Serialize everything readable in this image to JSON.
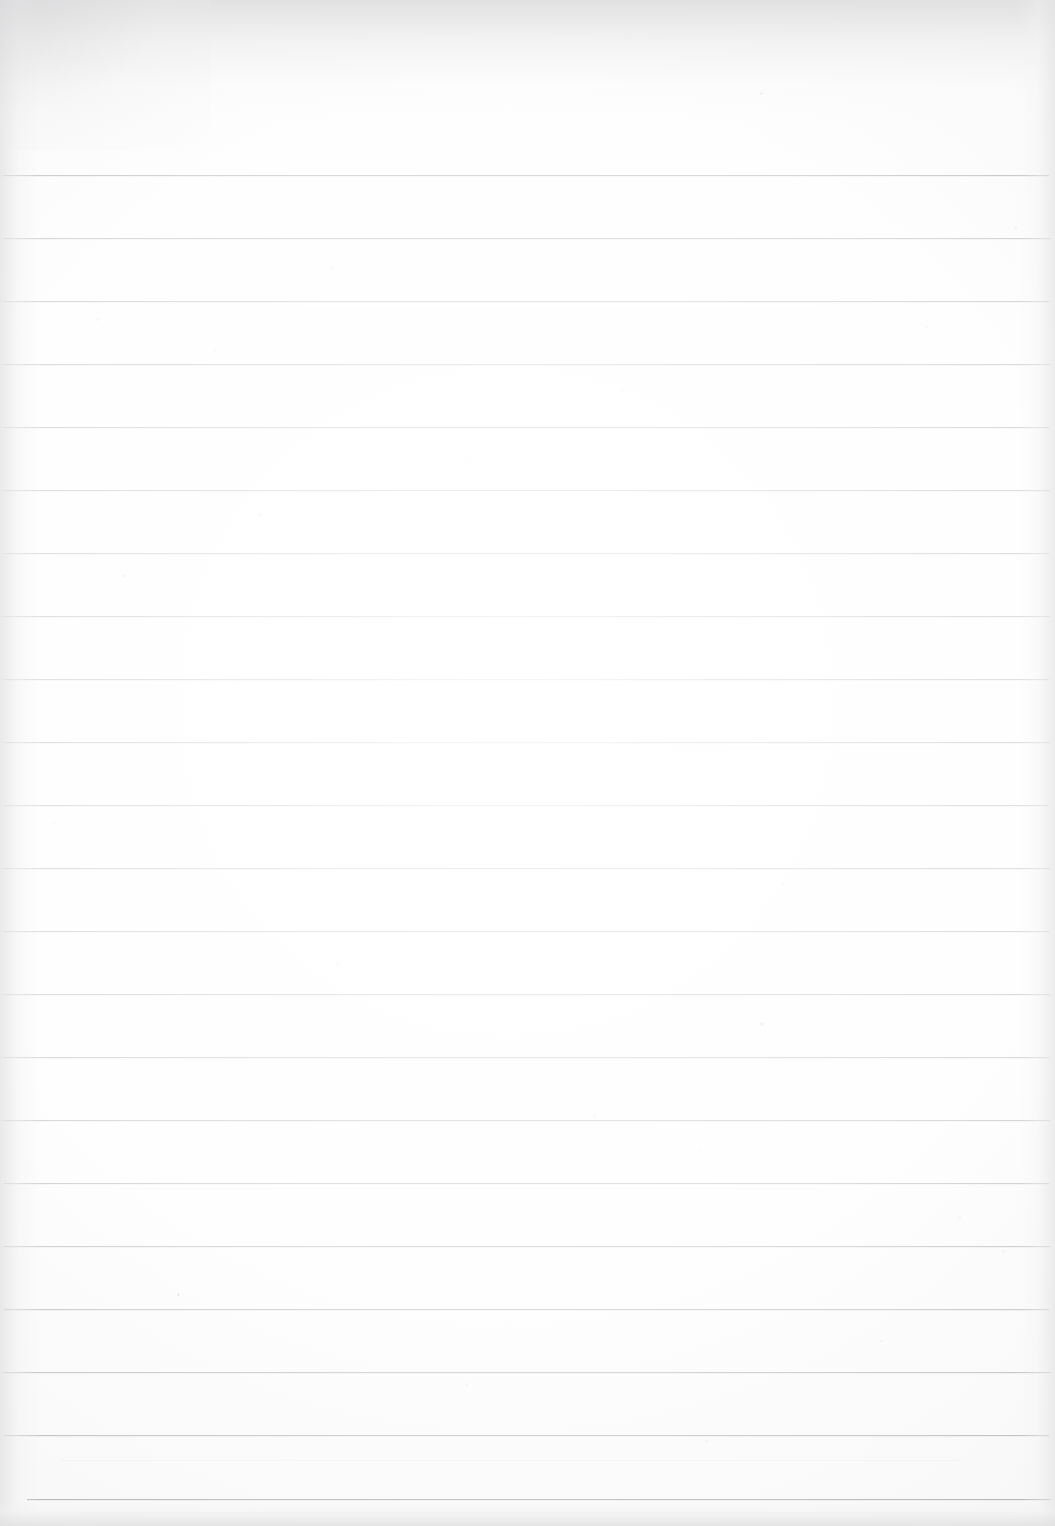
{
  "document": {
    "kind": "scanned-lined-notebook-page",
    "title": "Blank Ruled Notebook Page",
    "page_width": 1055,
    "page_height": 1526,
    "content_text": "",
    "has_handwriting": false,
    "has_printed_text": false,
    "is_blank": true
  },
  "paper": {
    "background_color": "#fcfcfc",
    "rule_color": "#54575c",
    "edge_shadow_color": "#dddddd",
    "line_count": 22,
    "line_spacing_px": 63,
    "first_line_y": 175,
    "last_line_y": 1499,
    "default_line_left_x": 4,
    "default_line_right_x": 1050,
    "top_margin_px": 175,
    "bottom_margin_px": 27
  },
  "rules": [
    {
      "index": 1,
      "y": 175,
      "x1": 3,
      "x2": 1049,
      "weight": "strong"
    },
    {
      "index": 2,
      "y": 238,
      "x1": 4,
      "x2": 1050,
      "weight": "normal"
    },
    {
      "index": 3,
      "y": 301,
      "x1": 4,
      "x2": 1049,
      "weight": "normal"
    },
    {
      "index": 4,
      "y": 364,
      "x1": 3,
      "x2": 1050,
      "weight": "normal"
    },
    {
      "index": 5,
      "y": 427,
      "x1": 4,
      "x2": 1049,
      "weight": "normal"
    },
    {
      "index": 6,
      "y": 490,
      "x1": 3,
      "x2": 1050,
      "weight": "normal"
    },
    {
      "index": 7,
      "y": 553,
      "x1": 4,
      "x2": 1049,
      "weight": "normal"
    },
    {
      "index": 8,
      "y": 616,
      "x1": 3,
      "x2": 1050,
      "weight": "normal"
    },
    {
      "index": 9,
      "y": 679,
      "x1": 4,
      "x2": 1049,
      "weight": "normal"
    },
    {
      "index": 10,
      "y": 742,
      "x1": 3,
      "x2": 1050,
      "weight": "normal"
    },
    {
      "index": 11,
      "y": 805,
      "x1": 4,
      "x2": 1049,
      "weight": "normal"
    },
    {
      "index": 12,
      "y": 868,
      "x1": 3,
      "x2": 1050,
      "weight": "normal"
    },
    {
      "index": 13,
      "y": 931,
      "x1": 4,
      "x2": 1049,
      "weight": "normal"
    },
    {
      "index": 14,
      "y": 994,
      "x1": 3,
      "x2": 1050,
      "weight": "normal"
    },
    {
      "index": 15,
      "y": 1057,
      "x1": 4,
      "x2": 1049,
      "weight": "normal"
    },
    {
      "index": 16,
      "y": 1120,
      "x1": 3,
      "x2": 1050,
      "weight": "normal"
    },
    {
      "index": 17,
      "y": 1183,
      "x1": 4,
      "x2": 1049,
      "weight": "normal"
    },
    {
      "index": 18,
      "y": 1246,
      "x1": 3,
      "x2": 1050,
      "weight": "normal"
    },
    {
      "index": 19,
      "y": 1309,
      "x1": 4,
      "x2": 1049,
      "weight": "normal"
    },
    {
      "index": 20,
      "y": 1372,
      "x1": 3,
      "x2": 1050,
      "weight": "normal"
    },
    {
      "index": 21,
      "y": 1435,
      "x1": 4,
      "x2": 1049,
      "weight": "normal"
    },
    {
      "index": 22,
      "y": 1499,
      "x1": 27,
      "x2": 1050,
      "weight": "strong"
    }
  ],
  "specks": [
    {
      "x": 760,
      "y": 92,
      "size": 3,
      "tone": "dark"
    },
    {
      "x": 629,
      "y": 36,
      "size": 2,
      "tone": "light"
    },
    {
      "x": 1014,
      "y": 226,
      "size": 3,
      "tone": "light"
    },
    {
      "x": 330,
      "y": 267,
      "size": 3,
      "tone": "light"
    },
    {
      "x": 96,
      "y": 318,
      "size": 3,
      "tone": "light"
    },
    {
      "x": 925,
      "y": 325,
      "size": 3,
      "tone": "light"
    },
    {
      "x": 214,
      "y": 350,
      "size": 3,
      "tone": "light"
    },
    {
      "x": 621,
      "y": 389,
      "size": 3,
      "tone": "light"
    },
    {
      "x": 470,
      "y": 460,
      "size": 2,
      "tone": "light"
    },
    {
      "x": 160,
      "y": 455,
      "size": 2,
      "tone": "light"
    },
    {
      "x": 258,
      "y": 513,
      "size": 4,
      "tone": "light"
    },
    {
      "x": 645,
      "y": 527,
      "size": 2,
      "tone": "light"
    },
    {
      "x": 123,
      "y": 574,
      "size": 3,
      "tone": "dark"
    },
    {
      "x": 598,
      "y": 635,
      "size": 3,
      "tone": "light"
    },
    {
      "x": 52,
      "y": 822,
      "size": 3,
      "tone": "light"
    },
    {
      "x": 781,
      "y": 883,
      "size": 3,
      "tone": "light"
    },
    {
      "x": 336,
      "y": 963,
      "size": 3,
      "tone": "light"
    },
    {
      "x": 760,
      "y": 1022,
      "size": 4,
      "tone": "dark"
    },
    {
      "x": 593,
      "y": 1114,
      "size": 3,
      "tone": "light"
    },
    {
      "x": 700,
      "y": 1150,
      "size": 2,
      "tone": "light"
    },
    {
      "x": 177,
      "y": 1293,
      "size": 3,
      "tone": "dark"
    },
    {
      "x": 958,
      "y": 1216,
      "size": 3,
      "tone": "light"
    },
    {
      "x": 1002,
      "y": 1250,
      "size": 3,
      "tone": "light"
    },
    {
      "x": 465,
      "y": 1383,
      "size": 3,
      "tone": "light"
    },
    {
      "x": 880,
      "y": 1340,
      "size": 2,
      "tone": "light"
    },
    {
      "x": 705,
      "y": 1440,
      "size": 3,
      "tone": "light"
    }
  ],
  "streaks": [
    {
      "x": 120,
      "y": 1188,
      "width": 700
    },
    {
      "x": 60,
      "y": 1460,
      "width": 900
    },
    {
      "x": 300,
      "y": 310,
      "width": 520
    },
    {
      "x": 520,
      "y": 748,
      "width": 420
    },
    {
      "x": 80,
      "y": 1512,
      "width": 940
    }
  ]
}
